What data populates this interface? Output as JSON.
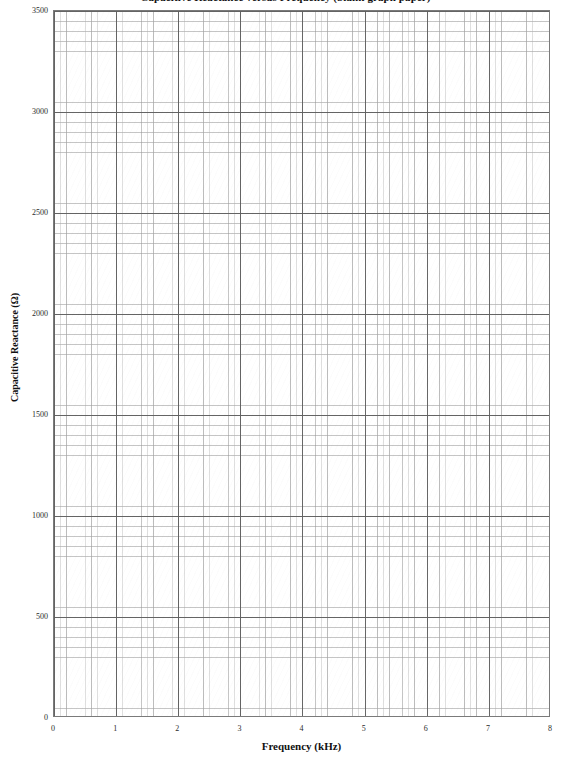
{
  "chart_data": {
    "type": "line",
    "title": "Capacitive Reactance versus Frequency (blank graph paper)",
    "xlabel": "Frequency (kHz)",
    "ylabel": "Capacitive Reactance (Ω)",
    "xlim": [
      0,
      8
    ],
    "ylim": [
      0,
      3500
    ],
    "x_major_step": 1,
    "x_minor_step": 0.2,
    "y_major_step": 500,
    "y_minor_step": 50,
    "xticks": [
      "0",
      "1",
      "2",
      "3",
      "4",
      "5",
      "6",
      "7",
      "8"
    ],
    "yticks": [
      "0",
      "500",
      "1000",
      "1500",
      "2000",
      "2500",
      "3000",
      "3500"
    ],
    "grid": true,
    "minor_grid": true,
    "legend": null,
    "series": [],
    "x": [],
    "values": [],
    "annotations": [],
    "note": "Empty plotting grid — no data series are drawn on the axes."
  },
  "figure": {
    "title": "Capacitive Reactance versus Frequency (blank graph paper)",
    "axes": {
      "x_axis": {
        "label": "Frequency (kHz)",
        "ticks": [
          "0",
          "1",
          "2",
          "3",
          "4",
          "5",
          "6",
          "7",
          "8"
        ]
      },
      "y_axis": {
        "label": "Capacitive Reactance (Ω)",
        "ticks": [
          "0",
          "500",
          "1000",
          "1500",
          "2000",
          "2500",
          "3000",
          "3500"
        ]
      }
    },
    "colors": {
      "background": "#ffffff",
      "major_grid": "#5f5f5f",
      "minor_grid": "#969696",
      "frame": "#7a7a7a",
      "text": "#1a1a1a"
    }
  }
}
